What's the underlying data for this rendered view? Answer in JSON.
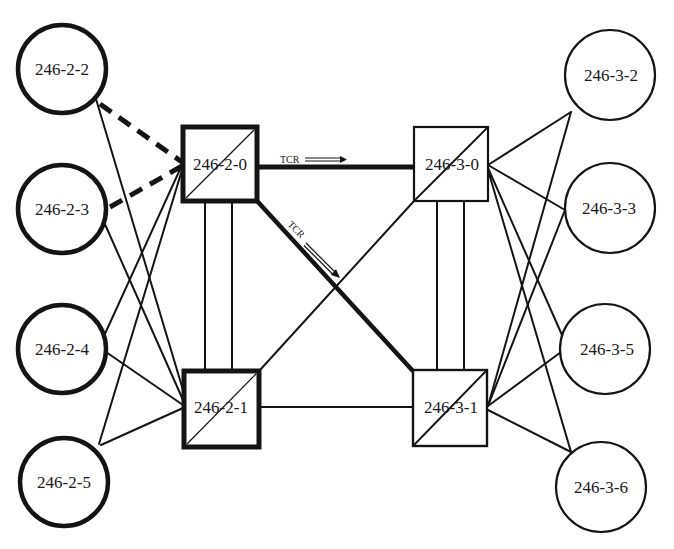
{
  "colors": {
    "stroke": "#141414",
    "background": "#ffffff",
    "text": "#1a1a1a"
  },
  "nodes": {
    "n246_2_2": {
      "label": "246-2-2",
      "shape": "circle",
      "cx": 62,
      "cy": 69,
      "r": 45,
      "border": "thick"
    },
    "n246_2_3": {
      "label": "246-2-3",
      "shape": "circle",
      "cx": 62,
      "cy": 209,
      "r": 45,
      "border": "thick"
    },
    "n246_2_4": {
      "label": "246-2-4",
      "shape": "circle",
      "cx": 62,
      "cy": 349,
      "r": 45,
      "border": "thick"
    },
    "n246_2_5": {
      "label": "246-2-5",
      "shape": "circle",
      "cx": 64,
      "cy": 482,
      "r": 45,
      "border": "thick"
    },
    "n246_3_2": {
      "label": "246-3-2",
      "shape": "circle",
      "cx": 610,
      "cy": 75,
      "r": 45,
      "border": "thin"
    },
    "n246_3_3": {
      "label": "246-3-3",
      "shape": "circle",
      "cx": 610,
      "cy": 208,
      "r": 45,
      "border": "thin"
    },
    "n246_3_5": {
      "label": "246-3-5",
      "shape": "circle",
      "cx": 605,
      "cy": 349,
      "r": 45,
      "border": "thin"
    },
    "n246_3_6": {
      "label": "246-3-6",
      "shape": "circle",
      "cx": 601,
      "cy": 487,
      "r": 45,
      "border": "thin"
    },
    "n246_2_0": {
      "label": "246-2-0",
      "shape": "square",
      "x": 182,
      "y": 126,
      "w": 76,
      "h": 76,
      "border": "thick"
    },
    "n246_3_0": {
      "label": "246-3-0",
      "shape": "square",
      "x": 414,
      "y": 127,
      "w": 74,
      "h": 74,
      "border": "thin"
    },
    "n246_2_1": {
      "label": "246-2-1",
      "shape": "square",
      "x": 183,
      "y": 370,
      "w": 77,
      "h": 78,
      "border": "thick"
    },
    "n246_3_1": {
      "label": "246-3-1",
      "shape": "square",
      "x": 412,
      "y": 370,
      "w": 75,
      "h": 76,
      "border": "thin"
    }
  },
  "edges": {
    "tcr_horizontal": {
      "from": "246-2-0",
      "to": "246-3-0",
      "style": "thick",
      "label": "TCR",
      "arrow": "right"
    },
    "tcr_diagonal": {
      "from": "246-2-0",
      "to": "246-3-1",
      "style": "thick",
      "label": "TCR",
      "arrow": "down-right"
    },
    "dashed_1": {
      "from": "246-2-2",
      "to": "246-2-0",
      "style": "dashed"
    },
    "dashed_2": {
      "from": "246-2-3",
      "to": "246-2-0",
      "style": "dashed"
    },
    "thin_list": [
      "246-2-2 — 246-2-1",
      "246-2-3 — 246-2-1",
      "246-2-4 — 246-2-0",
      "246-2-4 — 246-2-1",
      "246-2-5 — 246-2-0",
      "246-2-5 — 246-2-1",
      "246-2-1 — 246-3-0",
      "246-2-1 — 246-3-1",
      "246-2-0 — 246-2-1 (double)",
      "246-3-0 — 246-3-1 (double)",
      "246-3-0 — 246-3-2",
      "246-3-0 — 246-3-3",
      "246-3-0 — 246-3-5",
      "246-3-0 — 246-3-6",
      "246-3-1 — 246-3-2",
      "246-3-1 — 246-3-3",
      "246-3-1 — 246-3-5",
      "246-3-1 — 246-3-6"
    ]
  }
}
